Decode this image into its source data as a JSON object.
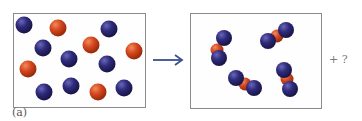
{
  "figure": {
    "part_label": "(a)",
    "plus_unknown": "+ ?",
    "colors": {
      "blue_atom": "#2e2a7a",
      "red_atom": "#d5471e",
      "arrow": "#3a4f8f",
      "frame": "#8a8a8a"
    },
    "left_box": {
      "description": "Separate atoms before reaction",
      "blue_atoms": 9,
      "red_atoms": 6
    },
    "right_box": {
      "description": "Triatomic molecules (blue-red-blue) after reaction",
      "molecules": 4,
      "molecule_composition": "blue-red-blue"
    }
  }
}
